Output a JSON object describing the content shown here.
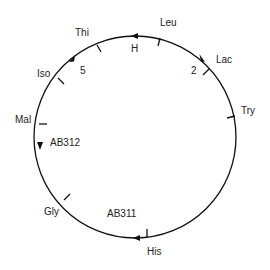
{
  "diagram": {
    "type": "circular genetic map",
    "direction_arrows": "counterclockwise on left, clockwise on right",
    "genes": [
      {
        "label": "Leu",
        "x": 160,
        "y": 18
      },
      {
        "label": "Lac",
        "x": 216,
        "y": 55
      },
      {
        "label": "Try",
        "x": 241,
        "y": 106
      },
      {
        "label": "His",
        "x": 147,
        "y": 247
      },
      {
        "label": "Gly",
        "x": 44,
        "y": 207
      },
      {
        "label": "Mal",
        "x": 15,
        "y": 115
      },
      {
        "label": "Iso",
        "x": 37,
        "y": 69
      },
      {
        "label": "Thi",
        "x": 75,
        "y": 28
      }
    ],
    "strains": [
      {
        "label": "H",
        "x": 131,
        "y": 44
      },
      {
        "label": "2",
        "x": 191,
        "y": 66
      },
      {
        "label": "5",
        "x": 80,
        "y": 66
      },
      {
        "label": "AB312",
        "x": 50,
        "y": 138
      },
      {
        "label": "AB311",
        "x": 107,
        "y": 209
      }
    ]
  }
}
